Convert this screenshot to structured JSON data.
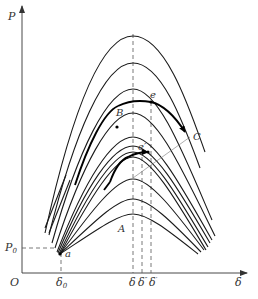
{
  "figure": {
    "axes": {
      "y_label": "P",
      "x_label": "δ",
      "origin_label": "O",
      "y_tick_label": "P",
      "y_tick_sub": "0",
      "x_ticks": [
        {
          "base": "δ",
          "sub": "0"
        },
        {
          "base": "δ",
          "sub": ""
        },
        {
          "base": "δ",
          "sup": "″"
        },
        {
          "base": "δ",
          "sup": "′"
        }
      ]
    },
    "point_labels": {
      "a": "a",
      "A": "A",
      "B": "B",
      "C": "C",
      "e": "e",
      "e_prime": "e′"
    },
    "curve_family": {
      "description": "Family of power-angle (P–δ) curves sharing a common starting point a, peaking near δ",
      "count": 11,
      "peak_y_px": [
        36,
        63,
        89,
        113,
        137,
        146,
        152,
        157,
        179,
        199,
        214
      ]
    },
    "colors": {
      "curve": "#1a1a1a",
      "axis": "#333333",
      "dashed": "#555555",
      "background": "#ffffff"
    }
  }
}
